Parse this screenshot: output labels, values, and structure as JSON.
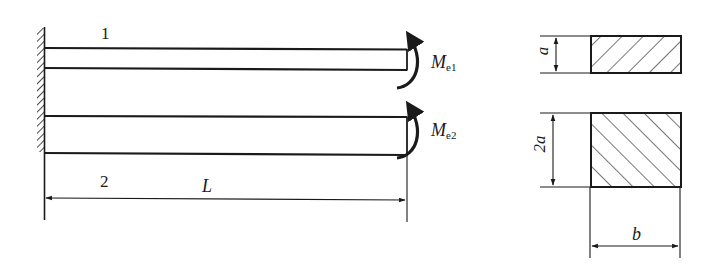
{
  "figure": {
    "type": "engineering-diagram",
    "colors": {
      "stroke": "#1a1a1a",
      "background": "#ffffff"
    }
  },
  "beams": [
    {
      "id": "1",
      "label": "1",
      "moment_label_main": "M",
      "moment_label_sub": "e1",
      "cross_section_height": "a"
    },
    {
      "id": "2",
      "label": "2",
      "moment_label_main": "M",
      "moment_label_sub": "e2",
      "cross_section_height": "2a"
    }
  ],
  "dimensions": {
    "length_label": "L",
    "section_1_height": "a",
    "section_2_height": "2a",
    "section_width": "b"
  },
  "support": {
    "type": "fixed-wall"
  }
}
